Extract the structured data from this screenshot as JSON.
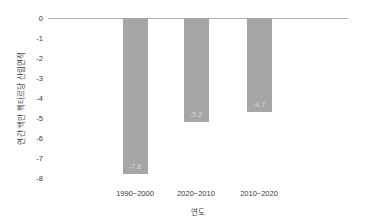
{
  "colors": {
    "bar": "#a6a6a6",
    "bar_label": "#d9d9d9",
    "axis_line": "#b0b0b0",
    "tick_text": "#3a3a3a"
  },
  "chart_data": {
    "type": "bar",
    "title": "",
    "xlabel": "연도",
    "ylabel": "연간 백만 헥타르당 산림면적",
    "categories": [
      "1990~2000",
      "2020~2010",
      "2010~2020"
    ],
    "values": [
      -7.8,
      -5.2,
      -4.7
    ],
    "bar_labels": [
      "-7.8",
      "-5.2",
      "-4.7"
    ],
    "ylim": [
      -8,
      0
    ],
    "yticks": [
      0,
      -1,
      -2,
      -3,
      -4,
      -5,
      -6,
      -7,
      -8
    ],
    "grid": false,
    "legend": null,
    "bar_label_position": "inside-bottom"
  }
}
